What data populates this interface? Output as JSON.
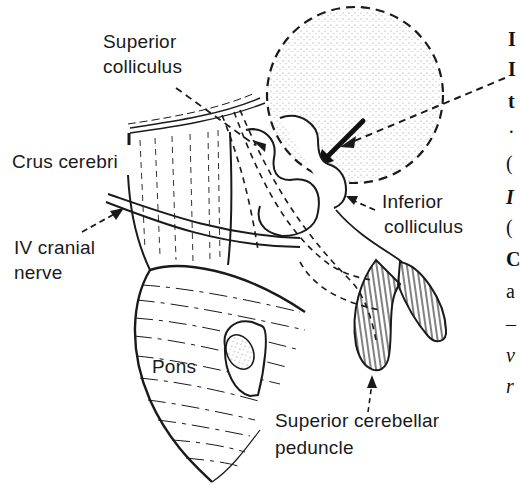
{
  "figure": {
    "labels": {
      "superior_colliculus": [
        "Superior",
        "colliculus"
      ],
      "crus_cerebri": "Crus cerebri",
      "iv_cranial_nerve": [
        "IV cranial",
        "nerve"
      ],
      "inferior_colliculus": [
        "Inferior",
        "colliculus"
      ],
      "pons": "Pons",
      "superior_cerebellar_peduncle": [
        "Superior cerebellar",
        "peduncle"
      ]
    },
    "right_margin_fragments": [
      "I",
      "I",
      "t",
      "·",
      "(",
      "I",
      "(",
      "C",
      "a",
      "–",
      "v",
      "r"
    ]
  },
  "colors": {
    "ink": "#1a1a1a",
    "background": "#ffffff",
    "stipple": "#555555"
  }
}
